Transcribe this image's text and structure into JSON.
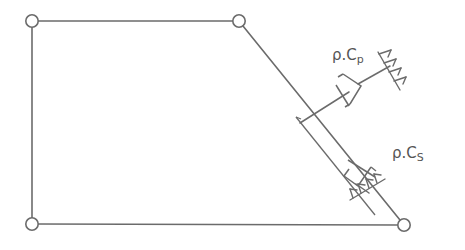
{
  "diagram": {
    "type": "mechanism-schematic",
    "background_color": "#ffffff",
    "line_color": "#6b6b6b",
    "text_color": "#555555",
    "joints": [
      {
        "name": "top-left",
        "cx": 32,
        "cy": 21,
        "r": 6.2
      },
      {
        "name": "top-right",
        "cx": 239,
        "cy": 21,
        "r": 6.2
      },
      {
        "name": "bottom-left",
        "cx": 32,
        "cy": 224,
        "r": 6.2
      },
      {
        "name": "bottom-right",
        "cx": 404,
        "cy": 225,
        "r": 6.2
      }
    ],
    "links": [
      {
        "name": "top-bar",
        "x1": 38,
        "y1": 21,
        "x2": 233,
        "y2": 21
      },
      {
        "name": "left-bar",
        "x1": 32,
        "y1": 27,
        "x2": 32,
        "y2": 218
      },
      {
        "name": "bottom-bar",
        "x1": 38,
        "y1": 224,
        "x2": 398,
        "y2": 225
      },
      {
        "name": "diagonal-bar",
        "x1": 243,
        "y1": 26,
        "x2": 400,
        "y2": 220
      }
    ],
    "dampers": [
      {
        "name": "damper-cp",
        "label_base": "ρ.C",
        "label_sub": "p",
        "attach_x": 300,
        "attach_y": 122,
        "elbow_x": 322,
        "elbow_y": 122,
        "piston_x": 362,
        "piston_y": 80,
        "ground_x": 392,
        "ground_y": 72
      },
      {
        "name": "damper-cs",
        "label_base": "ρ.C",
        "label_sub": "S",
        "attach_x": 348,
        "attach_y": 166,
        "piston_x": 368,
        "piston_y": 183,
        "ground_x": 378,
        "ground_y": 196
      }
    ],
    "labels": [
      {
        "name": "label-damper-cp",
        "base": "ρ.C",
        "sub": "p",
        "x": 332,
        "y": 48
      },
      {
        "name": "label-damper-cs",
        "base": "ρ.C",
        "sub": "S",
        "x": 392,
        "y": 146
      }
    ]
  }
}
